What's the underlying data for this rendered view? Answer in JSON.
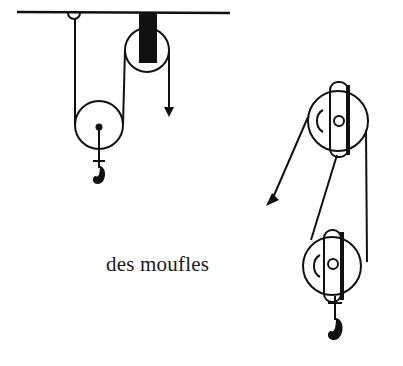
{
  "caption": "des moufles",
  "colors": {
    "ink": "#111111",
    "background": "#ffffff"
  },
  "figures": [
    {
      "name": "single-movable-pulley-system",
      "parts": [
        "ceiling-beam",
        "fixed-pulley",
        "movable-pulley",
        "hook",
        "pull-arrow-down"
      ]
    },
    {
      "name": "block-and-tackle",
      "parts": [
        "upper-block",
        "lower-block",
        "hook",
        "pull-arrow-diagonal"
      ]
    }
  ]
}
